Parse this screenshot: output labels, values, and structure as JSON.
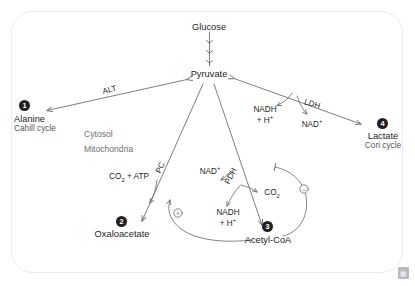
{
  "header": {
    "clipped_text": ""
  },
  "diagram": {
    "metabolites": {
      "glucose": "Glucose",
      "pyruvate": "Pyruvate",
      "alanine": "Alanine",
      "lactate": "Lactate",
      "oxaloacetate": "Oxaloacetate",
      "acetyl_coa": "Acetyl-CoA"
    },
    "subcaptions": {
      "alanine": "Cahill cycle",
      "lactate": "Cori cycle"
    },
    "compartments": {
      "cytosol": "Cytosol",
      "mitochondria": "Mitochondria"
    },
    "enzymes": {
      "alt": "ALT",
      "ldh": "LDH",
      "pc": "PC",
      "pdh": "PDH"
    },
    "cofactors": {
      "ldh_nadh": "NADH",
      "ldh_h": "+ H",
      "ldh_h_sup": "+",
      "ldh_nad": "NAD",
      "ldh_nad_sup": "+",
      "pdh_nad": "NAD",
      "pdh_nad_sup": "+",
      "pdh_nadh": "NADH",
      "pdh_h": "+ H",
      "pdh_h_sup": "+",
      "pdh_co2": "CO",
      "pdh_co2_sub": "2",
      "pc_substrate": "CO",
      "pc_substrate_sub": "2",
      "pc_substrate_tail": " + ATP"
    },
    "badges": {
      "one": "1",
      "two": "2",
      "three": "3",
      "four": "4"
    },
    "regulation": {
      "activation_symbol": "+",
      "inhibition_symbol": "−",
      "activator_note": "acetyl-CoA activates pyruvate carboxylase",
      "inhibitor_note": "acetyl-CoA inhibits pyruvate dehydrogenase"
    },
    "colors": {
      "ink": "#231f20",
      "stroke": "#6f6f74",
      "muted": "#6e6e72",
      "card_border": "#ececed",
      "background": "#ffffff"
    },
    "watermark_glyph": "▦"
  }
}
